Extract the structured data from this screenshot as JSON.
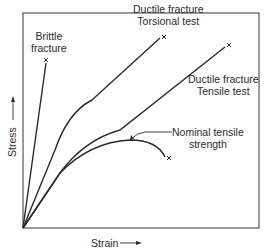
{
  "diagram": {
    "type": "stress-strain curves",
    "axes": {
      "x_label": "Strain",
      "y_label": "Stress"
    },
    "curves": [
      {
        "name": "brittle",
        "label_line1": "Brittle",
        "label_line2": "fracture",
        "end_marker": "×"
      },
      {
        "name": "torsional",
        "label_line1": "Ductile fracture",
        "label_line2": "Torsional test",
        "end_marker": "×"
      },
      {
        "name": "tensile",
        "label_line1": "Ductile fracture",
        "label_line2": "Tensile test",
        "end_marker": "×"
      },
      {
        "name": "nominal",
        "label_line1": "Nominal tensile",
        "label_line2": "strength",
        "end_marker": "×"
      }
    ],
    "colors": {
      "line": "#2a2a2a",
      "frame": "#555555",
      "background": "#ffffff"
    }
  }
}
